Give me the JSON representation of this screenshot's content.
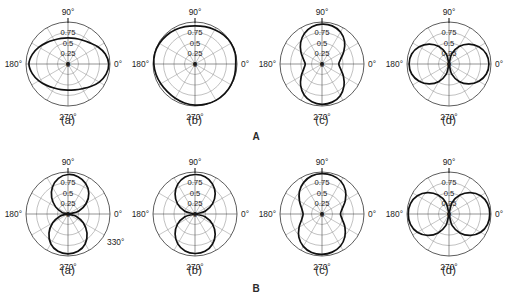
{
  "figure": {
    "bg_color": "#ffffff",
    "curve_color": "#111111",
    "grid_color": "#8d8d8d",
    "outline_color": "#4a4a4a",
    "bottom_caption": ""
  },
  "sections": [
    {
      "id": "A",
      "label": "A"
    },
    {
      "id": "B",
      "label": "B"
    }
  ],
  "chart_data": [
    {
      "type": "line",
      "coordinate_system": "polar",
      "section": "A",
      "panel": "(a)",
      "title": "",
      "angle_unit": "degrees",
      "angle_ticks": [
        "90°",
        "180°",
        "270°",
        "0°"
      ],
      "radial_ticks": [
        "0",
        "0.25",
        "0.5",
        "0.75"
      ],
      "rlim": [
        0,
        1
      ],
      "grid": true,
      "grid_circles": [
        0.25,
        0.5,
        0.75,
        1.0
      ],
      "spoke_step_deg": 30,
      "theta": [
        0,
        15,
        30,
        45,
        60,
        75,
        90,
        105,
        120,
        135,
        150,
        165,
        180,
        195,
        210,
        225,
        240,
        255,
        270,
        285,
        300,
        315,
        330,
        345,
        360
      ],
      "r": [
        0.97,
        0.92,
        0.82,
        0.72,
        0.66,
        0.63,
        0.62,
        0.63,
        0.66,
        0.72,
        0.8,
        0.88,
        0.93,
        0.88,
        0.8,
        0.72,
        0.66,
        0.63,
        0.62,
        0.64,
        0.68,
        0.76,
        0.86,
        0.94,
        0.97
      ]
    },
    {
      "type": "line",
      "coordinate_system": "polar",
      "section": "A",
      "panel": "(b)",
      "title": "",
      "angle_unit": "degrees",
      "angle_ticks": [
        "90°",
        "180°",
        "270°",
        "0°"
      ],
      "radial_ticks": [
        "0",
        "0.25",
        "0.5",
        "0.75"
      ],
      "rlim": [
        0,
        1
      ],
      "grid": true,
      "grid_circles": [
        0.25,
        0.5,
        0.75,
        1.0
      ],
      "spoke_step_deg": 30,
      "theta": [
        0,
        15,
        30,
        45,
        60,
        75,
        90,
        105,
        120,
        135,
        150,
        165,
        180,
        195,
        210,
        225,
        240,
        255,
        270,
        285,
        300,
        315,
        330,
        345,
        360
      ],
      "r": [
        0.97,
        0.99,
        0.99,
        0.97,
        0.94,
        0.92,
        0.91,
        0.92,
        0.94,
        0.96,
        0.98,
        0.99,
        0.98,
        0.96,
        0.94,
        0.93,
        0.94,
        0.96,
        0.98,
        0.99,
        1.0,
        1.0,
        0.99,
        0.98,
        0.97
      ]
    },
    {
      "type": "line",
      "coordinate_system": "polar",
      "section": "A",
      "panel": "(c)",
      "title": "",
      "angle_unit": "degrees",
      "angle_ticks": [
        "90°",
        "180°",
        "270°",
        "0°"
      ],
      "radial_ticks": [
        "0",
        "0.25",
        "0.5",
        "0.75"
      ],
      "rlim": [
        0,
        1
      ],
      "grid": true,
      "grid_circles": [
        0.25,
        0.5,
        0.75,
        1.0
      ],
      "spoke_step_deg": 30,
      "theta": [
        0,
        15,
        30,
        45,
        60,
        75,
        90,
        105,
        120,
        135,
        150,
        165,
        180,
        195,
        210,
        225,
        240,
        255,
        270,
        285,
        300,
        315,
        330,
        345,
        360
      ],
      "r": [
        0.4,
        0.46,
        0.6,
        0.76,
        0.88,
        0.94,
        0.95,
        0.92,
        0.84,
        0.72,
        0.58,
        0.46,
        0.4,
        0.45,
        0.57,
        0.72,
        0.85,
        0.93,
        0.96,
        0.94,
        0.87,
        0.74,
        0.59,
        0.46,
        0.4
      ]
    },
    {
      "type": "line",
      "coordinate_system": "polar",
      "section": "A",
      "panel": "(d)",
      "title": "",
      "angle_unit": "degrees",
      "angle_ticks": [
        "90°",
        "180°",
        "270°",
        "0°"
      ],
      "radial_ticks": [
        "0",
        "0.25",
        "0.5",
        "0.75"
      ],
      "rlim": [
        0,
        1
      ],
      "grid": true,
      "grid_circles": [
        0.25,
        0.5,
        0.75,
        1.0
      ],
      "spoke_step_deg": 30,
      "theta": [
        0,
        15,
        30,
        45,
        60,
        75,
        90,
        105,
        120,
        135,
        150,
        165,
        180,
        195,
        210,
        225,
        240,
        255,
        270,
        285,
        300,
        315,
        330,
        345,
        360
      ],
      "r": [
        0.95,
        0.92,
        0.82,
        0.67,
        0.48,
        0.25,
        0.03,
        0.25,
        0.48,
        0.67,
        0.82,
        0.92,
        0.95,
        0.92,
        0.82,
        0.67,
        0.48,
        0.25,
        0.03,
        0.25,
        0.48,
        0.67,
        0.82,
        0.92,
        0.95
      ]
    },
    {
      "type": "line",
      "coordinate_system": "polar",
      "section": "B",
      "panel": "(a)",
      "title": "",
      "angle_unit": "degrees",
      "angle_ticks": [
        "90°",
        "180°",
        "270°",
        "0°",
        "330°"
      ],
      "radial_ticks": [
        "0",
        "0.25",
        "0.5",
        "0.75"
      ],
      "rlim": [
        0,
        1
      ],
      "grid": true,
      "grid_circles": [
        0.25,
        0.5,
        0.75,
        1.0
      ],
      "spoke_step_deg": 30,
      "theta": [
        0,
        15,
        30,
        45,
        60,
        75,
        90,
        105,
        120,
        135,
        150,
        165,
        180,
        195,
        210,
        225,
        240,
        255,
        270,
        285,
        300,
        315,
        330,
        345,
        360
      ],
      "r": [
        0.03,
        0.26,
        0.5,
        0.7,
        0.84,
        0.92,
        0.94,
        0.88,
        0.74,
        0.55,
        0.34,
        0.15,
        0.03,
        0.2,
        0.42,
        0.64,
        0.82,
        0.92,
        0.95,
        0.92,
        0.82,
        0.64,
        0.42,
        0.2,
        0.03
      ]
    },
    {
      "type": "line",
      "coordinate_system": "polar",
      "section": "B",
      "panel": "(b)",
      "title": "",
      "angle_unit": "degrees",
      "angle_ticks": [
        "90°",
        "180°",
        "270°",
        "0°"
      ],
      "radial_ticks": [
        "0",
        "0.25",
        "0.5",
        "0.75"
      ],
      "rlim": [
        0,
        1
      ],
      "grid": true,
      "grid_circles": [
        0.25,
        0.5,
        0.75,
        1.0
      ],
      "spoke_step_deg": 30,
      "theta": [
        0,
        15,
        30,
        45,
        60,
        75,
        90,
        105,
        120,
        135,
        150,
        165,
        180,
        195,
        210,
        225,
        240,
        255,
        270,
        285,
        300,
        315,
        330,
        345,
        360
      ],
      "r": [
        0.04,
        0.25,
        0.48,
        0.68,
        0.83,
        0.92,
        0.94,
        0.91,
        0.82,
        0.67,
        0.48,
        0.25,
        0.04,
        0.25,
        0.48,
        0.67,
        0.82,
        0.91,
        0.94,
        0.92,
        0.83,
        0.68,
        0.48,
        0.25,
        0.04
      ]
    },
    {
      "type": "line",
      "coordinate_system": "polar",
      "section": "B",
      "panel": "(c)",
      "title": "",
      "angle_unit": "degrees",
      "angle_ticks": [
        "90°",
        "180°",
        "270°",
        "0°"
      ],
      "radial_ticks": [
        "0",
        "0.25",
        "0.5",
        "0.75"
      ],
      "rlim": [
        0,
        1
      ],
      "grid": true,
      "grid_circles": [
        0.25,
        0.5,
        0.75,
        1.0
      ],
      "spoke_step_deg": 30,
      "theta": [
        0,
        15,
        30,
        45,
        60,
        75,
        90,
        105,
        120,
        135,
        150,
        165,
        180,
        195,
        210,
        225,
        240,
        255,
        270,
        285,
        300,
        315,
        330,
        345,
        360
      ],
      "r": [
        0.44,
        0.5,
        0.64,
        0.79,
        0.9,
        0.95,
        0.96,
        0.94,
        0.87,
        0.76,
        0.62,
        0.5,
        0.45,
        0.5,
        0.63,
        0.78,
        0.89,
        0.95,
        0.96,
        0.94,
        0.88,
        0.77,
        0.63,
        0.5,
        0.44
      ]
    },
    {
      "type": "line",
      "coordinate_system": "polar",
      "section": "B",
      "panel": "(d)",
      "title": "",
      "angle_unit": "degrees",
      "angle_ticks": [
        "90°",
        "180°",
        "270°",
        "0°"
      ],
      "radial_ticks": [
        "0",
        "0.25",
        "0.5",
        "0.75"
      ],
      "rlim": [
        0,
        1
      ],
      "grid": true,
      "grid_circles": [
        0.25,
        0.5,
        0.75,
        1.0
      ],
      "spoke_step_deg": 30,
      "theta": [
        0,
        15,
        30,
        45,
        60,
        75,
        90,
        105,
        120,
        135,
        150,
        165,
        180,
        195,
        210,
        225,
        240,
        255,
        270,
        285,
        300,
        315,
        330,
        345,
        360
      ],
      "r": [
        0.97,
        0.95,
        0.87,
        0.72,
        0.52,
        0.28,
        0.04,
        0.28,
        0.52,
        0.72,
        0.87,
        0.95,
        0.97,
        0.95,
        0.87,
        0.72,
        0.52,
        0.28,
        0.04,
        0.28,
        0.52,
        0.72,
        0.87,
        0.95,
        0.97
      ]
    }
  ]
}
